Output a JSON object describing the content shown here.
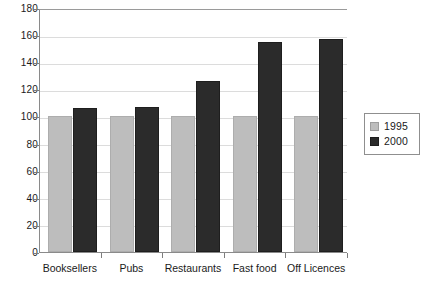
{
  "chart_data": {
    "type": "bar",
    "title": "",
    "xlabel": "",
    "ylabel": "",
    "categories": [
      "Booksellers",
      "Pubs",
      "Restaurants",
      "Fast food",
      "Off Licences"
    ],
    "series": [
      {
        "name": "1995",
        "color": "#bdbdbd",
        "values": [
          100,
          100,
          100,
          100,
          100
        ]
      },
      {
        "name": "2000",
        "color": "#2b2b2b",
        "values": [
          106,
          107,
          126,
          155,
          157
        ]
      }
    ],
    "ylim": [
      0,
      180
    ],
    "yticks": [
      0,
      20,
      40,
      60,
      80,
      100,
      120,
      140,
      160,
      180
    ],
    "ytick_labels": [
      "0",
      "20",
      "40",
      "60",
      "80",
      "100",
      "120",
      "140",
      "160",
      "180"
    ],
    "grid": true,
    "grid_axis": "y",
    "legend_position": "right",
    "legend_entries": [
      "1995",
      "2000"
    ]
  },
  "legend": {
    "entries": [
      {
        "label": "1995"
      },
      {
        "label": "2000"
      }
    ]
  }
}
